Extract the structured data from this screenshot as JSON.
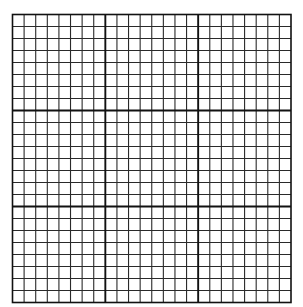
{
  "grid": {
    "columns": 24,
    "rows": 24,
    "major_every": 8,
    "origin_x": 12.5,
    "origin_y": 14.5,
    "width": 278.5,
    "height": 288,
    "colors": {
      "background": "#ffffff",
      "minor_line": "#2a2a2a",
      "major_line": "#111111"
    },
    "minor_width": 1.1,
    "major_width": 1.9,
    "border_width": 1.6
  }
}
